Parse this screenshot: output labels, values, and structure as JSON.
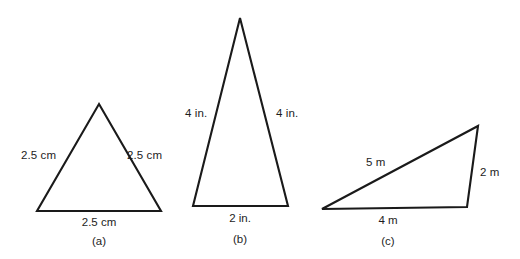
{
  "figure": {
    "background_color": "#ffffff",
    "stroke_color": "#1a1a1a",
    "text_color": "#1d1d1d",
    "width": 520,
    "height": 259
  },
  "shapes": [
    {
      "id": "triangle-a",
      "type": "isosceles-triangle",
      "caption": "(a)",
      "points": "99,104 161,211 37,211",
      "unit": "cm",
      "side_labels": {
        "left": "2.5 cm",
        "right": "2.5 cm",
        "base": "2.5 cm"
      }
    },
    {
      "id": "triangle-b",
      "type": "isosceles-triangle",
      "caption": "(b)",
      "points": "240,18 288,206 193,206",
      "unit": "in.",
      "side_labels": {
        "left": "4 in.",
        "right": "4 in.",
        "base": "2 in."
      }
    },
    {
      "id": "triangle-c",
      "type": "right-triangle",
      "caption": "(c)",
      "points": "478,126 467,207 322,209",
      "unit": "m",
      "side_labels": {
        "hypotenuse": "5 m",
        "vertical": "2 m",
        "base": "4 m"
      }
    }
  ]
}
